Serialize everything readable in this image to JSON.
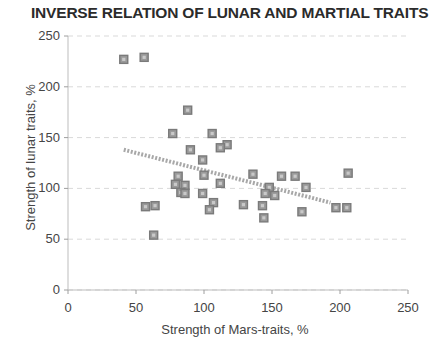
{
  "chart_data": {
    "type": "scatter",
    "title": "INVERSE RELATION OF LUNAR AND MARTIAL TRAITS",
    "xlabel": "Strength of Mars-traits, %",
    "ylabel": "Strength of lunar traits, %",
    "xlim": [
      0,
      250
    ],
    "ylim": [
      0,
      250
    ],
    "xticks": [
      0,
      50,
      100,
      150,
      200,
      250
    ],
    "yticks": [
      0,
      50,
      100,
      150,
      200,
      250
    ],
    "grid": true,
    "legend": null,
    "marker": {
      "shape": "square",
      "color": "#7a7a7a",
      "size": 8
    },
    "points": [
      {
        "x": 41,
        "y": 227
      },
      {
        "x": 56,
        "y": 229
      },
      {
        "x": 88,
        "y": 177
      },
      {
        "x": 77,
        "y": 154
      },
      {
        "x": 106,
        "y": 154
      },
      {
        "x": 117,
        "y": 143
      },
      {
        "x": 90,
        "y": 138
      },
      {
        "x": 112,
        "y": 140
      },
      {
        "x": 99,
        "y": 128
      },
      {
        "x": 81,
        "y": 112
      },
      {
        "x": 100,
        "y": 113
      },
      {
        "x": 136,
        "y": 114
      },
      {
        "x": 157,
        "y": 112
      },
      {
        "x": 167,
        "y": 112
      },
      {
        "x": 206,
        "y": 115
      },
      {
        "x": 79,
        "y": 104
      },
      {
        "x": 86,
        "y": 103
      },
      {
        "x": 112,
        "y": 105
      },
      {
        "x": 148,
        "y": 101
      },
      {
        "x": 175,
        "y": 101
      },
      {
        "x": 83,
        "y": 96
      },
      {
        "x": 86,
        "y": 95
      },
      {
        "x": 99,
        "y": 95
      },
      {
        "x": 145,
        "y": 95
      },
      {
        "x": 152,
        "y": 93
      },
      {
        "x": 197,
        "y": 81
      },
      {
        "x": 205,
        "y": 81
      },
      {
        "x": 57,
        "y": 82
      },
      {
        "x": 64,
        "y": 83
      },
      {
        "x": 107,
        "y": 86
      },
      {
        "x": 129,
        "y": 84
      },
      {
        "x": 143,
        "y": 83
      },
      {
        "x": 104,
        "y": 79
      },
      {
        "x": 172,
        "y": 77
      },
      {
        "x": 144,
        "y": 71
      },
      {
        "x": 63,
        "y": 54
      }
    ],
    "trendline": {
      "from": {
        "x": 41,
        "y": 138
      },
      "to": {
        "x": 193,
        "y": 86
      },
      "color": "#a8a8a8",
      "style": "dotted-thick"
    }
  }
}
